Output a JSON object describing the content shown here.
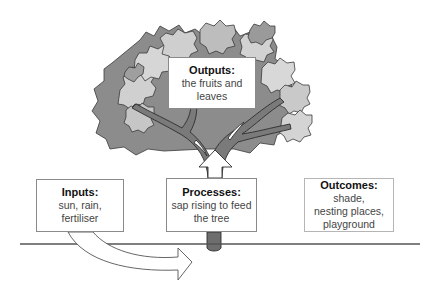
{
  "diagram": {
    "type": "tree-metaphor-process-model",
    "colors": {
      "line": "#555555",
      "box_border": "#8a8a8a",
      "leaf_light": "#d4d4d4",
      "leaf_mid": "#a9a9a9",
      "leaf_dark": "#7e7e7e",
      "trunk": "#6e6e6e"
    },
    "boxes": {
      "outputs": {
        "title": "Outputs:",
        "body": "the fruits and\nleaves"
      },
      "inputs": {
        "title": "Inputs:",
        "body": "sun, rain,\nfertiliser"
      },
      "processes": {
        "title": "Processes:",
        "body": "sap rising to feed\nthe tree"
      },
      "outcomes": {
        "title": "Outcomes:",
        "body": "shade,\nnesting places,\nplayground"
      }
    },
    "arrows": [
      {
        "from": "inputs",
        "to": "processes",
        "style": "curved-hollow"
      },
      {
        "from": "processes",
        "to": "outputs",
        "style": "straight-hollow-up"
      }
    ]
  }
}
